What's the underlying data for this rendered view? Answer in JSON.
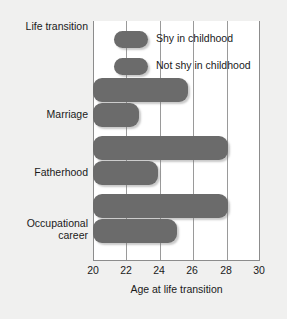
{
  "chart_data": {
    "type": "bar",
    "orientation": "horizontal",
    "title": "",
    "xlabel": "Age at life transition",
    "ylabel": "Life transition",
    "xlim": [
      20,
      30
    ],
    "xticks": [
      20,
      22,
      24,
      26,
      28,
      30
    ],
    "grid": true,
    "legend_position": "top-left-inside",
    "categories": [
      "Marriage",
      "Fatherhood",
      "Occupational career"
    ],
    "series": [
      {
        "name": "Shy in childhood",
        "values": [
          25.7,
          28.1,
          28.1
        ],
        "color": "#6b6b6b"
      },
      {
        "name": "Not shy in childhood",
        "values": [
          22.7,
          23.9,
          25.0
        ],
        "color": "#6b6b6b"
      }
    ]
  },
  "axes": {
    "y_title": "Life transition",
    "x_title": "Age at life transition",
    "x_tick_labels": [
      "20",
      "22",
      "24",
      "26",
      "28",
      "30"
    ],
    "category_labels": [
      {
        "line1": "Marriage",
        "line2": ""
      },
      {
        "line1": "Fatherhood",
        "line2": ""
      },
      {
        "line1": "Occupational",
        "line2": "career"
      }
    ]
  },
  "legend": {
    "items": [
      {
        "label": "Shy in childhood"
      },
      {
        "label": "Not shy in childhood"
      }
    ]
  }
}
